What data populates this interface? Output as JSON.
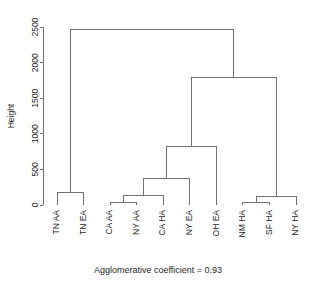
{
  "chart_data": {
    "type": "dendrogram",
    "title": "",
    "subtitle": "",
    "caption": "Agglomerative coefficient = 0.93",
    "ylabel": "Height",
    "xlabel": "",
    "ylim": [
      0,
      2600
    ],
    "yticks": [
      0,
      500,
      1000,
      1500,
      2000,
      2500
    ],
    "ytick_labels": [
      "0",
      "500",
      "1000",
      "1500",
      "2000",
      "2500"
    ],
    "grid": false,
    "legend": null,
    "axis_color": "#6b6b6b",
    "line_color": "#707070",
    "leaves": [
      {
        "label": "TN AA",
        "order": 0
      },
      {
        "label": "TN EA",
        "order": 1
      },
      {
        "label": "CA AA",
        "order": 2
      },
      {
        "label": "NY AA",
        "order": 3
      },
      {
        "label": "CA HA",
        "order": 4
      },
      {
        "label": "NY EA",
        "order": 5
      },
      {
        "label": "OH EA",
        "order": 6
      },
      {
        "label": "NM HA",
        "order": 7
      },
      {
        "label": "SF HA",
        "order": 8
      },
      {
        "label": "NY HA",
        "order": 9
      }
    ],
    "merges": [
      {
        "id": "m1",
        "left": "TN AA",
        "right": "TN EA",
        "height": 175
      },
      {
        "id": "m2",
        "left": "CA AA",
        "right": "NY AA",
        "height": 35
      },
      {
        "id": "m3",
        "left": "m2",
        "right": "CA HA",
        "height": 130
      },
      {
        "id": "m4",
        "left": "m3",
        "right": "NY EA",
        "height": 370
      },
      {
        "id": "m5",
        "left": "m4",
        "right": "OH EA",
        "height": 820
      },
      {
        "id": "m6",
        "left": "NM HA",
        "right": "SF HA",
        "height": 35
      },
      {
        "id": "m7",
        "left": "m6",
        "right": "NY HA",
        "height": 125
      },
      {
        "id": "m8",
        "left": "m5",
        "right": "m7",
        "height": 1790
      },
      {
        "id": "m9",
        "left": "m1",
        "right": "m8",
        "height": 2460
      }
    ]
  },
  "plot": {
    "height_axis_label": "Height",
    "footer_caption": "Agglomerative coefficient = 0.93"
  }
}
